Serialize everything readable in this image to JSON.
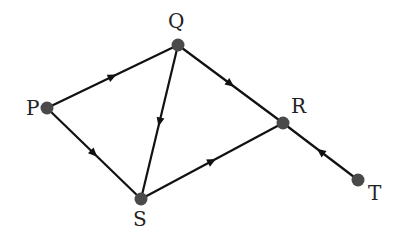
{
  "diagram": {
    "type": "directed-graph",
    "nodes": [
      {
        "id": "P",
        "label": "P",
        "x": 47,
        "y": 108,
        "lx": 26,
        "ly": 115
      },
      {
        "id": "Q",
        "label": "Q",
        "x": 178,
        "y": 45,
        "lx": 168,
        "ly": 28
      },
      {
        "id": "R",
        "label": "R",
        "x": 283,
        "y": 123,
        "lx": 291,
        "ly": 113
      },
      {
        "id": "S",
        "label": "S",
        "x": 141,
        "y": 199,
        "lx": 133,
        "ly": 226
      },
      {
        "id": "T",
        "label": "T",
        "x": 358,
        "y": 180,
        "lx": 368,
        "ly": 200
      }
    ],
    "edges": [
      {
        "from": "P",
        "to": "Q"
      },
      {
        "from": "P",
        "to": "S"
      },
      {
        "from": "Q",
        "to": "S"
      },
      {
        "from": "Q",
        "to": "R"
      },
      {
        "from": "S",
        "to": "R"
      },
      {
        "from": "T",
        "to": "R"
      }
    ],
    "colors": {
      "edge": "#111111",
      "node": "#4a4a4a",
      "label": "#222222"
    }
  }
}
